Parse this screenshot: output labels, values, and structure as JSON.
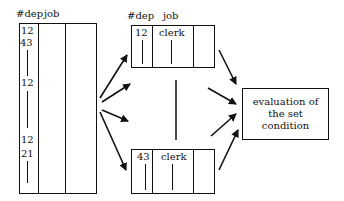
{
  "left_table": {
    "headers": {
      "dep": "#dep",
      "job": "job"
    },
    "dep_values": [
      "12",
      "43",
      "12",
      "12",
      "21"
    ]
  },
  "top_table": {
    "headers": {
      "dep": "#dep",
      "job": "job"
    },
    "row": {
      "dep": "12",
      "job": "clerk"
    }
  },
  "bottom_table": {
    "row": {
      "dep": "43",
      "job": "clerk"
    }
  },
  "evaluation_box": {
    "lines": [
      "evaluation of",
      "the set",
      "condition"
    ]
  },
  "colors": {
    "ink": "#111111",
    "background": "#ffffff"
  }
}
